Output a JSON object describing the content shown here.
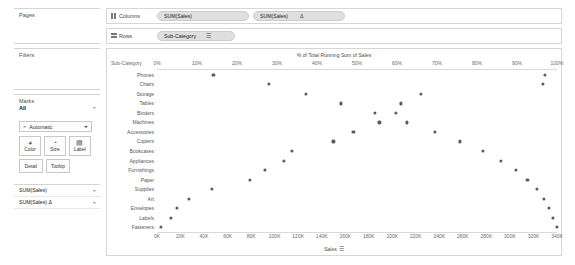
{
  "panels": {
    "pages": {
      "title": "Pages"
    },
    "filters": {
      "title": "Filters"
    },
    "marks": {
      "title": "Marks",
      "all_label": "All",
      "mark_type": "Automatic",
      "buttons": [
        {
          "name": "color",
          "label": "Color",
          "glyph": "◕"
        },
        {
          "name": "size",
          "label": "Size",
          "glyph": "◔"
        },
        {
          "name": "label",
          "label": "Label",
          "glyph": "▤"
        },
        {
          "name": "detail",
          "label": "Detail",
          "glyph": ""
        },
        {
          "name": "tooltip",
          "label": "Tooltip",
          "glyph": ""
        }
      ]
    },
    "measures": {
      "items": [
        {
          "label": "SUM(Sales)"
        },
        {
          "label": "SUM(Sales) Δ"
        }
      ]
    }
  },
  "shelves": {
    "columns": {
      "label": "Columns",
      "icon": "columns-icon",
      "pills": [
        {
          "text": "SUM(Sales)",
          "suffix": ""
        },
        {
          "text": "SUM(Sales)",
          "suffix": "Δ"
        }
      ]
    },
    "rows": {
      "label": "Rows",
      "icon": "rows-icon",
      "pills": [
        {
          "text": "Sub-Category",
          "sort": "☰"
        }
      ]
    }
  },
  "chart_data": {
    "type": "scatter",
    "title": "% of Total Running Sum of Sales",
    "row_header_label": "Sub-Category",
    "xlabel_bottom": "Sales",
    "bottom_sort_glyph": "☰",
    "categories": [
      "Phones",
      "Chairs",
      "Storage",
      "Tables",
      "Binders",
      "Machines",
      "Accessories",
      "Copiers",
      "Bookcases",
      "Appliances",
      "Furnishings",
      "Paper",
      "Supplies",
      "Art",
      "Envelopes",
      "Labels",
      "Fasteners"
    ],
    "top_axis": {
      "label": "% of Total Running Sum of Sales",
      "ticks": [
        "0%",
        "10%",
        "20%",
        "30%",
        "40%",
        "50%",
        "60%",
        "70%",
        "80%",
        "90%",
        "100%"
      ],
      "values": [
        0,
        10,
        20,
        30,
        40,
        50,
        60,
        70,
        80,
        90,
        100
      ],
      "min": 0,
      "max": 100
    },
    "bottom_axis": {
      "label": "Sales",
      "ticks": [
        "0K",
        "20K",
        "40K",
        "60K",
        "80K",
        "100K",
        "120K",
        "140K",
        "160K",
        "180K",
        "200K",
        "220K",
        "240K",
        "260K",
        "280K",
        "300K",
        "320K",
        "340K"
      ],
      "values": [
        0,
        20,
        40,
        60,
        80,
        100,
        120,
        140,
        160,
        180,
        200,
        220,
        240,
        260,
        280,
        300,
        320,
        340
      ],
      "min": 0,
      "max": 340
    },
    "series": [
      {
        "name": "SUM(Sales)",
        "axis": "bottom",
        "units": "K",
        "values": [
          330,
          328,
          224,
          207,
          203,
          189,
          167,
          150,
          115,
          108,
          92,
          79,
          47,
          27,
          17,
          12,
          3
        ]
      },
      {
        "name": "% of Total Running Sum of Sales",
        "axis": "top",
        "units": "%",
        "values": [
          14.1,
          27.9,
          37.3,
          46.0,
          54.5,
          62.4,
          56.8,
          53.8,
          51.7,
          48.9,
          44.4,
          40.5,
          97.5,
          98.4,
          99.0,
          99.5,
          100.0
        ]
      }
    ],
    "points": [
      {
        "category": "Phones",
        "pct": 14.1,
        "sales": 330
      },
      {
        "category": "Chairs",
        "pct": 27.9,
        "sales": 328
      },
      {
        "category": "Storage",
        "pct": 37.3,
        "sales": 224
      },
      {
        "category": "Tables",
        "pct": 46.0,
        "sales": 207
      },
      {
        "category": "Binders",
        "pct": 54.5,
        "sales": 203
      },
      {
        "category": "Machines",
        "pct": 62.4,
        "sales": 189
      },
      {
        "category": "Accessories",
        "pct": 69.4,
        "sales": 167
      },
      {
        "category": "Copiers",
        "pct": 75.8,
        "sales": 150
      },
      {
        "category": "Bookcases",
        "pct": 81.4,
        "sales": 115
      },
      {
        "category": "Appliances",
        "pct": 86.0,
        "sales": 108
      },
      {
        "category": "Furnishings",
        "pct": 89.8,
        "sales": 92
      },
      {
        "category": "Paper",
        "pct": 92.6,
        "sales": 79
      },
      {
        "category": "Supplies",
        "pct": 95.0,
        "sales": 47
      },
      {
        "category": "Art",
        "pct": 96.7,
        "sales": 27
      },
      {
        "category": "Envelopes",
        "pct": 97.9,
        "sales": 17
      },
      {
        "category": "Labels",
        "pct": 98.9,
        "sales": 12
      },
      {
        "category": "Fasteners",
        "pct": 100.0,
        "sales": 3
      }
    ],
    "grid": false,
    "legend": "none"
  },
  "colors": {
    "mark": "#5a5a5a",
    "pill": "#dfdfdf",
    "border": "#d6d6d6",
    "axis_text": "#6a6a6a"
  }
}
